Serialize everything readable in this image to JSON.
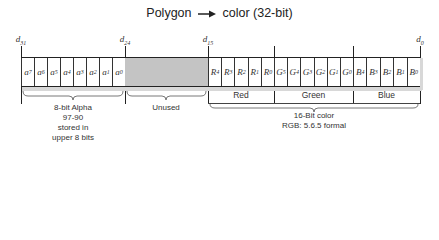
{
  "title": {
    "left": "Polygon",
    "arrow": "→",
    "right": "color (32-bit)"
  },
  "bit_markers": [
    {
      "label": "d",
      "sub": "31",
      "x": 21
    },
    {
      "label": "d",
      "sub": "24",
      "x": 125
    },
    {
      "label": "d",
      "sub": "15",
      "x": 208
    },
    {
      "label": "",
      "sub": "",
      "x": 274
    },
    {
      "label": "",
      "sub": "",
      "x": 353
    },
    {
      "label": "d",
      "sub": "0",
      "x": 420
    }
  ],
  "fields": {
    "alpha": {
      "cells": [
        {
          "letter": "a",
          "sub": "7"
        },
        {
          "letter": "a",
          "sub": "6"
        },
        {
          "letter": "a",
          "sub": "5"
        },
        {
          "letter": "a",
          "sub": "4"
        },
        {
          "letter": "a",
          "sub": "3"
        },
        {
          "letter": "a",
          "sub": "2"
        },
        {
          "letter": "a",
          "sub": "1"
        },
        {
          "letter": "a",
          "sub": "0"
        }
      ],
      "caption_lines": [
        "8-bit Alpha",
        "97-90",
        "stored in",
        "upper 8 bits"
      ]
    },
    "unused": {
      "caption": "Unused",
      "fill": "#c4c4c4"
    },
    "red": {
      "label": "Red",
      "cells": [
        {
          "letter": "R",
          "sub": "4"
        },
        {
          "letter": "R",
          "sub": "3"
        },
        {
          "letter": "R",
          "sub": "2"
        },
        {
          "letter": "R",
          "sub": "1"
        },
        {
          "letter": "R",
          "sub": "0"
        }
      ]
    },
    "green": {
      "label": "Green",
      "cells": [
        {
          "letter": "G",
          "sub": "5"
        },
        {
          "letter": "G",
          "sub": "4"
        },
        {
          "letter": "G",
          "sub": "3"
        },
        {
          "letter": "G",
          "sub": "2"
        },
        {
          "letter": "G",
          "sub": "1"
        },
        {
          "letter": "G",
          "sub": "0"
        }
      ]
    },
    "blue": {
      "label": "Blue",
      "cells": [
        {
          "letter": "B",
          "sub": "4"
        },
        {
          "letter": "B",
          "sub": "3"
        },
        {
          "letter": "B",
          "sub": "2"
        },
        {
          "letter": "B",
          "sub": "1"
        },
        {
          "letter": "B",
          "sub": "0"
        }
      ]
    },
    "color16": {
      "caption_lines": [
        "16-Bit color",
        "RGB: 5.6.5 formal"
      ]
    }
  }
}
